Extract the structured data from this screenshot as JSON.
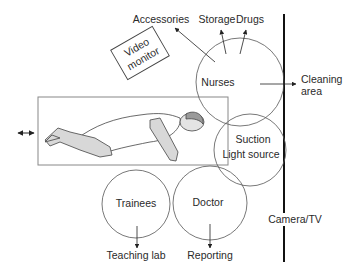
{
  "diagram": {
    "title": "",
    "nodes": {
      "nurses": {
        "label": "Nurses"
      },
      "suction": {
        "line1": "Suction",
        "line2": "Light source"
      },
      "doctor": {
        "label": "Doctor"
      },
      "trainees": {
        "label": "Trainees"
      },
      "video_monitor": {
        "line1": "Video",
        "line2": "monitor"
      }
    },
    "destinations": {
      "accessories": "Accessories",
      "storage": "Storage",
      "drugs": "Drugs",
      "cleaning": {
        "line1": "Cleaning",
        "line2": "area"
      },
      "teaching_lab": "Teaching lab",
      "reporting": "Reporting",
      "camera_tv": "Camera/TV"
    },
    "table": {
      "label": "patient-table",
      "movable": "horizontal"
    },
    "colors": {
      "stroke": "#555555",
      "wall": "#111111",
      "patient_fill": "#d8d8d8",
      "hair_fill": "#9a9a9a"
    }
  }
}
